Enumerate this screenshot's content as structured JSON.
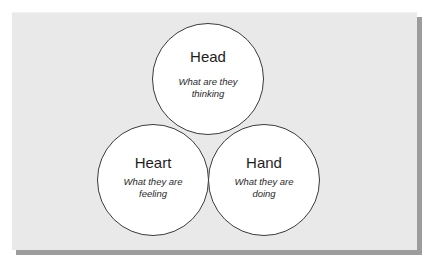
{
  "diagram": {
    "type": "three-circle model",
    "colors": {
      "panel_background": "#e9e9e9",
      "panel_shadow": "#9c9c9c",
      "circle_fill": "#ffffff",
      "circle_stroke": "#3a3a3a",
      "text": "#1e1e1e"
    },
    "circles": [
      {
        "id": "head",
        "title": "Head",
        "subtitle_lines": [
          "What are they",
          "thinking"
        ]
      },
      {
        "id": "heart",
        "title": "Heart",
        "subtitle_lines": [
          "What they are",
          "feeling"
        ]
      },
      {
        "id": "hand",
        "title": "Hand",
        "subtitle_lines": [
          "What they are",
          "doing"
        ]
      }
    ]
  }
}
